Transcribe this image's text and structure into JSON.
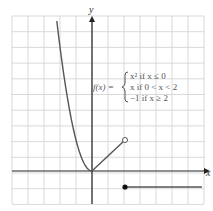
{
  "chart_data": {
    "type": "line",
    "title": "",
    "xlabel": "x",
    "ylabel": "y",
    "grid": true,
    "xlim": [
      -5,
      7
    ],
    "ylim": [
      -2,
      10
    ],
    "series": [
      {
        "name": "x^2 if x <= 0",
        "x": [
          -3.1,
          -2.5,
          -2,
          -1.5,
          -1,
          -0.5,
          0
        ],
        "y": [
          9.6,
          6.25,
          4,
          2.25,
          1,
          0.25,
          0
        ]
      },
      {
        "name": "x if 0 < x < 2",
        "x": [
          0,
          2
        ],
        "y": [
          0,
          2
        ],
        "endpoint": "open"
      },
      {
        "name": "-1 if x >= 2",
        "x": [
          2,
          7
        ],
        "y": [
          -1,
          -1
        ],
        "endpoint": "closed"
      }
    ],
    "annotations": [
      {
        "text": "f(x) =",
        "piece_lines": [
          "x² if x ≤ 0",
          "x if 0 < x < 2",
          "−1 if x ≥ 2"
        ]
      }
    ]
  },
  "labels": {
    "x_axis": "x",
    "y_axis": "y",
    "fx": "f(x) =",
    "piece1": "x² if x ≤ 0",
    "piece2": "x if 0 < x < 2",
    "piece3": "−1 if x ≥ 2"
  }
}
